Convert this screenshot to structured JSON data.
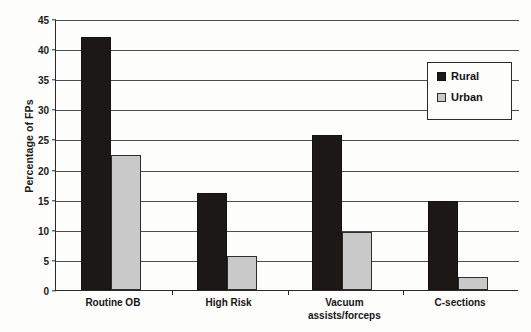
{
  "chart_data": {
    "type": "bar",
    "title": "",
    "xlabel": "",
    "ylabel": "Percentage of FPs",
    "ylim": [
      0,
      45
    ],
    "ytick_step": 5,
    "yticks": [
      0,
      5,
      10,
      15,
      20,
      25,
      30,
      35,
      40,
      45
    ],
    "ytick_labels": [
      "0",
      "5",
      "10",
      "15",
      "20",
      "25",
      "30",
      "35",
      "40",
      "45"
    ],
    "grid": "horizontal",
    "legend_position": "top-right",
    "categories": [
      "Routine OB",
      "High Risk",
      "Vacuum\nassists/forceps",
      "C-sections"
    ],
    "series": [
      {
        "name": "Rural",
        "color": "#1c1816",
        "values": [
          42.0,
          16.1,
          25.7,
          14.8
        ]
      },
      {
        "name": "Urban",
        "color": "#c9c9c9",
        "values": [
          22.4,
          5.6,
          9.6,
          2.2
        ]
      }
    ]
  },
  "legend": {
    "items": [
      {
        "label": "Rural",
        "swatch": "rural-swatch"
      },
      {
        "label": "Urban",
        "swatch": "urban-swatch"
      }
    ]
  }
}
